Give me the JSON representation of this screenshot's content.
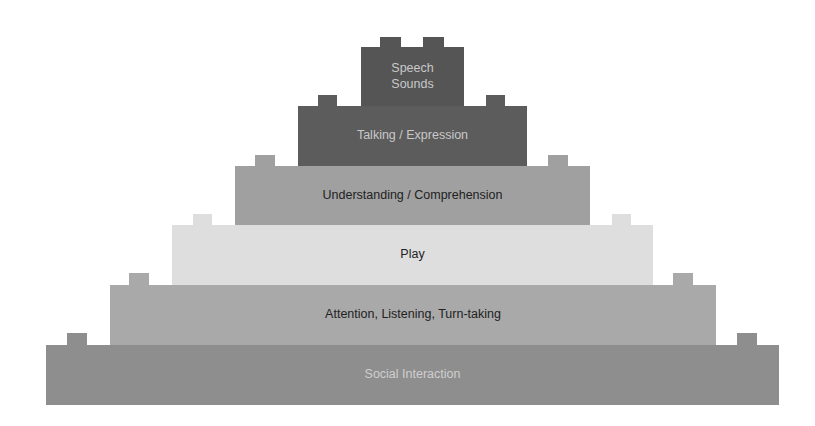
{
  "diagram": {
    "type": "pyramid",
    "layers": [
      {
        "label": "Speech Sounds",
        "line1": "Speech",
        "line2": "Sounds",
        "fill": "#555555",
        "text_color": "#c8c8c8",
        "box": {
          "x": 361,
          "y": 47,
          "w": 103,
          "h": 60
        },
        "studs": [
          {
            "x": 380,
            "y": 37,
            "w": 21,
            "h": 11
          },
          {
            "x": 423,
            "y": 37,
            "w": 21,
            "h": 11
          }
        ]
      },
      {
        "label": "Talking / Expression",
        "fill": "#5c5c5c",
        "text_color": "#c8c8c8",
        "box": {
          "x": 298,
          "y": 106,
          "w": 229,
          "h": 60
        },
        "studs": [
          {
            "x": 318,
            "y": 95,
            "w": 19,
            "h": 12
          },
          {
            "x": 486,
            "y": 95,
            "w": 19,
            "h": 12
          }
        ]
      },
      {
        "label": "Understanding / Comprehension",
        "fill": "#a0a0a0",
        "text_color": "#222222",
        "box": {
          "x": 235,
          "y": 166,
          "w": 355,
          "h": 59
        },
        "studs": [
          {
            "x": 255,
            "y": 155,
            "w": 20,
            "h": 12
          },
          {
            "x": 548,
            "y": 155,
            "w": 20,
            "h": 12
          }
        ]
      },
      {
        "label": "Play",
        "fill": "#dedede",
        "text_color": "#222222",
        "box": {
          "x": 172,
          "y": 225,
          "w": 481,
          "h": 60
        },
        "studs": [
          {
            "x": 193,
            "y": 214,
            "w": 19,
            "h": 12
          },
          {
            "x": 612,
            "y": 214,
            "w": 19,
            "h": 12
          }
        ]
      },
      {
        "label": "Attention, Listening, Turn-taking",
        "fill": "#a9a9a9",
        "text_color": "#222222",
        "box": {
          "x": 110,
          "y": 285,
          "w": 606,
          "h": 60
        },
        "studs": [
          {
            "x": 129,
            "y": 273,
            "w": 20,
            "h": 13
          },
          {
            "x": 673,
            "y": 273,
            "w": 20,
            "h": 13
          }
        ]
      },
      {
        "label": "Social Interaction",
        "fill": "#8e8e8e",
        "text_color": "#cfcfcf",
        "box": {
          "x": 46,
          "y": 345,
          "w": 733,
          "h": 60
        },
        "studs": [
          {
            "x": 67,
            "y": 333,
            "w": 20,
            "h": 13
          },
          {
            "x": 737,
            "y": 333,
            "w": 20,
            "h": 13
          }
        ]
      }
    ]
  }
}
